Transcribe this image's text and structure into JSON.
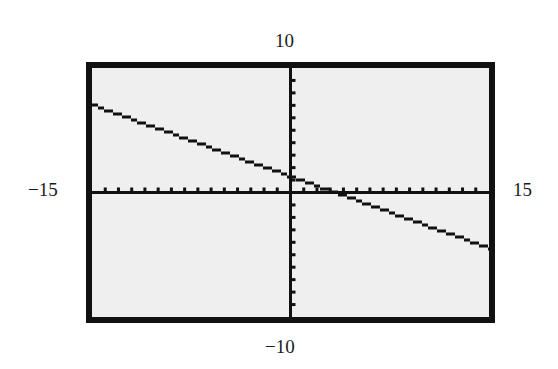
{
  "chart_data": {
    "type": "line",
    "title": "",
    "xlabel": "",
    "ylabel": "",
    "window": {
      "xmin": -15,
      "xmax": 15,
      "ymin": -10,
      "ymax": 10,
      "xscale": 1,
      "yscale": 1
    },
    "xlim": [
      -15,
      15
    ],
    "ylim": [
      -10,
      10
    ],
    "grid": false,
    "axes_tick_marks": true,
    "corner_labels": {
      "top": "10",
      "bottom": "−10",
      "left": "−15",
      "right": "15"
    },
    "series": [
      {
        "name": "y = -(3/8)x + 1.25",
        "x": [
          -15,
          15
        ],
        "y": [
          7,
          -4.5
        ]
      }
    ],
    "colors": {
      "screen_background": "#efefef",
      "frame": "#111111",
      "axes": "#111111",
      "line": "#111111"
    }
  }
}
